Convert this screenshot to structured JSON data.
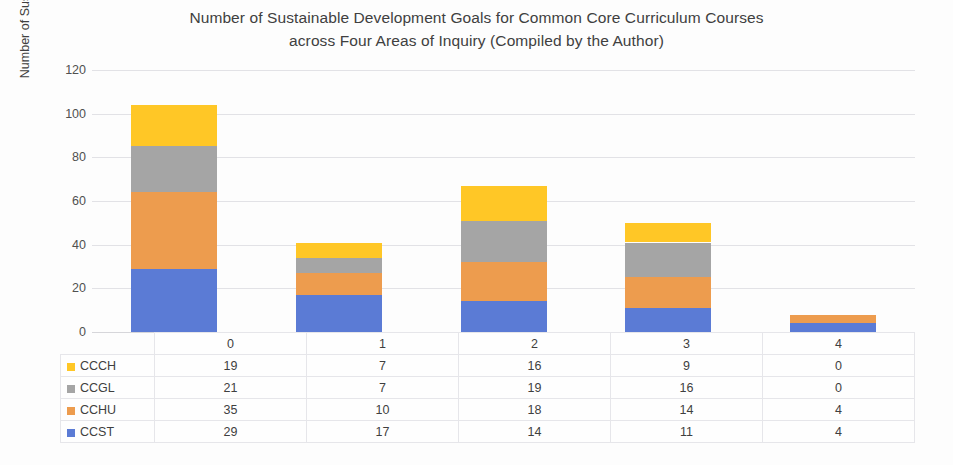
{
  "chart_data": {
    "type": "bar",
    "subtype": "stacked-column",
    "title": "Number of Sustainable Development Goals for Common Core Curriculum Courses across Four Areas of Inquiry (Compiled by the Author)",
    "title_lines": [
      "Number of Sustainable Development Goals for Common Core Curriculum Courses",
      "across Four Areas of Inquiry (Compiled by the Author)"
    ],
    "xlabel": "",
    "ylabel": "Number of Sustainable Development Goals",
    "categories": [
      "0",
      "1",
      "2",
      "3",
      "4"
    ],
    "ylim": [
      0,
      120
    ],
    "yticks": [
      0,
      20,
      40,
      60,
      80,
      100,
      120
    ],
    "grid": true,
    "legend_position": "data-table-left",
    "stack_order_bottom_to_top": [
      "CCST",
      "CCHU",
      "CCGL",
      "CCCH"
    ],
    "series": [
      {
        "name": "CCCH",
        "color": "#ffc726",
        "values": [
          19,
          7,
          16,
          9,
          0
        ]
      },
      {
        "name": "CCGL",
        "color": "#a5a5a5",
        "values": [
          21,
          7,
          19,
          16,
          0
        ]
      },
      {
        "name": "CCHU",
        "color": "#ed9c4e",
        "values": [
          35,
          10,
          18,
          14,
          4
        ]
      },
      {
        "name": "CCST",
        "color": "#5b7bd5",
        "values": [
          29,
          17,
          14,
          11,
          4
        ]
      }
    ],
    "totals": [
      104,
      41,
      67,
      50,
      8
    ]
  },
  "data_table": {
    "header": [
      "",
      "0",
      "1",
      "2",
      "3",
      "4"
    ],
    "rows": [
      {
        "label": "CCCH",
        "color": "#ffc726",
        "values": [
          "19",
          "7",
          "16",
          "9",
          "0"
        ]
      },
      {
        "label": "CCGL",
        "color": "#a5a5a5",
        "values": [
          "21",
          "7",
          "19",
          "16",
          "0"
        ]
      },
      {
        "label": "CCHU",
        "color": "#ed9c4e",
        "values": [
          "35",
          "10",
          "18",
          "14",
          "4"
        ]
      },
      {
        "label": "CCST",
        "color": "#5b7bd5",
        "values": [
          "29",
          "17",
          "14",
          "11",
          "4"
        ]
      }
    ]
  }
}
